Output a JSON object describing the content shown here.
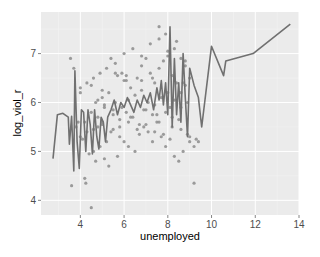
{
  "chart_data": {
    "type": "scatter",
    "title": "",
    "xlabel": "unemployed",
    "ylabel": "log_viol_r",
    "xlim": [
      2.2,
      14.0
    ],
    "ylim": [
      3.7,
      7.85
    ],
    "grid": true,
    "legend": "none",
    "x_ticks": [
      4,
      6,
      8,
      10,
      12,
      14
    ],
    "y_ticks": [
      4,
      5,
      6,
      7
    ],
    "x_tick_labels": [
      "4",
      "6",
      "8",
      "10",
      "12",
      "14"
    ],
    "y_tick_labels": [
      "4",
      "5",
      "6",
      "7"
    ],
    "colors": {
      "panel": "#ebebeb",
      "grid_major": "#ffffff",
      "grid_minor": "#f4f4f4",
      "points": "#8c8c8c",
      "line": "#707070"
    },
    "series": [
      {
        "name": "points",
        "kind": "scatter",
        "x": [
          3.6,
          3.55,
          4.2,
          4.25,
          4.5,
          4.7,
          5.1,
          5.3,
          5.7,
          5.2,
          4.9,
          4.6,
          4.4,
          4.0,
          3.9,
          4.1,
          4.3,
          4.8,
          5.0,
          5.5,
          5.8,
          6.0,
          6.2,
          6.5,
          6.7,
          6.9,
          7.1,
          7.3,
          7.5,
          7.7,
          7.9,
          8.1,
          8.3,
          8.5,
          8.7,
          8.9,
          9.0,
          9.2,
          4.0,
          4.3,
          4.6,
          4.9,
          5.2,
          5.4,
          5.6,
          5.9,
          6.1,
          6.3,
          6.6,
          6.8,
          7.0,
          7.2,
          7.4,
          7.6,
          7.8,
          8.0,
          8.2,
          8.4,
          8.6,
          8.8,
          5.0,
          5.3,
          5.6,
          5.9,
          6.2,
          6.5,
          6.8,
          7.1,
          7.4,
          7.7,
          8.0,
          8.3,
          8.6,
          8.9,
          6.0,
          6.4,
          6.8,
          7.2,
          7.6,
          8.0,
          8.4,
          8.8,
          4.5,
          4.8,
          5.1,
          5.5,
          5.8,
          6.1,
          6.4,
          6.7,
          7.0,
          7.3,
          7.6,
          7.9,
          8.2,
          8.5,
          3.8,
          4.2,
          4.6,
          5.0,
          5.4,
          5.8,
          6.2,
          6.6,
          7.0,
          7.4,
          7.8,
          8.2,
          8.6,
          9.0,
          9.3,
          6.3,
          6.9,
          7.5,
          8.1,
          8.7,
          5.7,
          6.0,
          7.6,
          7.9,
          8.3,
          8.8,
          9.0,
          4.7,
          5.1,
          5.5,
          4.0,
          4.5,
          5.0,
          5.6,
          6.1,
          6.8,
          7.3,
          4.8,
          3.7,
          9.2,
          9.4,
          8.6
        ],
        "y": [
          4.3,
          6.9,
          4.45,
          4.35,
          3.85,
          4.8,
          4.85,
          4.7,
          4.9,
          5.2,
          5.1,
          5.0,
          4.95,
          5.3,
          5.6,
          5.25,
          5.4,
          5.5,
          5.6,
          5.45,
          5.3,
          5.2,
          5.1,
          5.0,
          5.35,
          5.5,
          5.4,
          5.2,
          5.6,
          5.3,
          5.1,
          5.25,
          4.9,
          4.8,
          5.0,
          5.35,
          5.2,
          5.1,
          6.3,
          6.4,
          6.5,
          6.6,
          6.7,
          6.9,
          6.8,
          6.6,
          6.45,
          6.3,
          6.5,
          6.75,
          6.9,
          6.6,
          6.4,
          6.7,
          6.85,
          6.95,
          6.55,
          6.4,
          6.2,
          6.35,
          6.1,
          6.2,
          6.0,
          5.9,
          6.05,
          6.15,
          6.25,
          6.0,
          5.95,
          6.1,
          6.2,
          6.05,
          5.9,
          6.0,
          7.0,
          7.1,
          6.95,
          7.2,
          7.3,
          7.05,
          7.25,
          6.85,
          5.8,
          5.7,
          5.9,
          5.75,
          5.65,
          5.8,
          5.7,
          5.55,
          5.85,
          5.75,
          5.6,
          5.8,
          5.7,
          5.65,
          5.5,
          5.6,
          5.45,
          5.55,
          5.4,
          5.5,
          5.6,
          5.45,
          5.55,
          5.4,
          5.35,
          5.5,
          5.45,
          5.3,
          5.25,
          5.7,
          5.85,
          5.75,
          5.9,
          6.4,
          6.55,
          6.45,
          7.55,
          7.4,
          7.1,
          6.75,
          6.5,
          6.0,
          5.95,
          5.85,
          6.2,
          6.35,
          6.25,
          6.6,
          6.55,
          6.45,
          6.5,
          6.05,
          6.7,
          4.35,
          5.2,
          6.9
        ],
        "color": "#8c8c8c"
      },
      {
        "name": "line",
        "kind": "line",
        "x": [
          2.75,
          2.95,
          3.2,
          3.45,
          3.5,
          3.6,
          3.7,
          3.75,
          3.85,
          3.95,
          4.05,
          4.15,
          4.25,
          4.35,
          4.45,
          4.55,
          4.65,
          4.75,
          4.85,
          4.95,
          5.05,
          5.15,
          5.25,
          5.4,
          5.55,
          5.7,
          5.85,
          6.0,
          6.15,
          6.3,
          6.45,
          6.6,
          6.75,
          6.9,
          7.05,
          7.2,
          7.35,
          7.5,
          7.6,
          7.7,
          7.8,
          7.9,
          8.0,
          8.1,
          8.2,
          8.3,
          8.4,
          8.5,
          8.6,
          8.7,
          8.8,
          8.9,
          9.0,
          9.2,
          9.4,
          9.55,
          10.0,
          10.55,
          10.65,
          11.9,
          13.6
        ],
        "y": [
          4.85,
          5.75,
          5.78,
          5.7,
          5.15,
          5.72,
          4.6,
          6.65,
          5.2,
          4.65,
          5.85,
          5.8,
          5.0,
          5.85,
          5.55,
          4.95,
          5.85,
          5.3,
          5.05,
          5.7,
          5.6,
          5.2,
          5.7,
          5.85,
          6.05,
          5.75,
          6.0,
          5.9,
          6.1,
          5.95,
          5.8,
          6.05,
          5.9,
          6.15,
          6.0,
          6.2,
          5.85,
          6.3,
          6.05,
          6.45,
          5.95,
          6.4,
          5.75,
          7.55,
          5.5,
          6.9,
          5.75,
          6.4,
          5.6,
          7.0,
          6.1,
          5.3,
          6.7,
          6.35,
          6.1,
          5.5,
          7.15,
          6.55,
          6.85,
          7.0,
          7.6
        ],
        "color": "#707070"
      }
    ]
  }
}
